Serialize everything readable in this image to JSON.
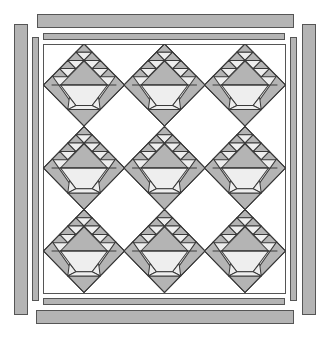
{
  "diagram": {
    "colors": {
      "fabric_dark": "#b4b4b4",
      "fabric_light": "#eeeeee",
      "background": "#ffffff",
      "outline": "#3a3a3a"
    },
    "grid": {
      "rows": 3,
      "columns": 3,
      "block_count": 9
    },
    "borders": {
      "inner": [
        "top",
        "bottom",
        "left",
        "right"
      ],
      "outer": [
        "top",
        "bottom",
        "left",
        "right"
      ]
    }
  }
}
